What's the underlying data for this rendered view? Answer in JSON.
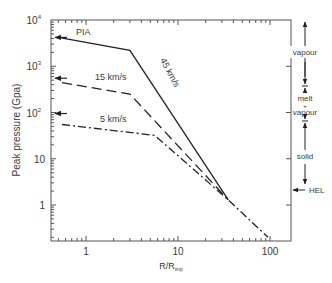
{
  "chart_data": {
    "type": "line",
    "title": "",
    "xlabel": "R/R",
    "xlabel_sub": "imp",
    "ylabel": "Peak pressure (Gpa)",
    "xscale": "log",
    "yscale": "log",
    "xlim": [
      0.42,
      160
    ],
    "ylim": [
      0.16,
      10000
    ],
    "grid": false,
    "x_ticks": [
      {
        "value": 1,
        "label": "1"
      },
      {
        "value": 10,
        "label": "10"
      },
      {
        "value": 100,
        "label": "100"
      }
    ],
    "y_ticks": [
      {
        "value": 1,
        "label": "1",
        "sup": ""
      },
      {
        "value": 10,
        "label": "10",
        "sup": ""
      },
      {
        "value": 100,
        "label": "10",
        "sup": "2"
      },
      {
        "value": 1000,
        "label": "10",
        "sup": "3"
      },
      {
        "value": 10000,
        "label": "10",
        "sup": "4"
      }
    ],
    "series": [
      {
        "name": "45 km/s",
        "label": "45 km/s",
        "style": "solid",
        "points": [
          [
            0.5,
            4200
          ],
          [
            3.0,
            2200
          ],
          [
            35,
            1.3
          ]
        ]
      },
      {
        "name": "15 km/s",
        "label": "15 km/s",
        "style": "dashed",
        "points": [
          [
            0.55,
            440
          ],
          [
            3.0,
            250
          ],
          [
            35,
            1.3
          ]
        ]
      },
      {
        "name": "5 km/s",
        "label": "5 km/s",
        "style": "dashdot",
        "points": [
          [
            0.55,
            55
          ],
          [
            5.6,
            32
          ],
          [
            35,
            1.3
          ],
          [
            95,
            0.2
          ]
        ]
      }
    ],
    "annotations": {
      "left_arrows": [
        {
          "label": "PIA",
          "y": 4200
        },
        {
          "label": "",
          "y": 550
        },
        {
          "label": "",
          "y": 95
        }
      ],
      "right_regimes": [
        {
          "label": "vapour",
          "y_from": 10000,
          "y_to": 600
        },
        {
          "label_lines": [
            "melt",
            "+",
            "vapour"
          ],
          "y_from": 600,
          "y_to": 90
        },
        {
          "label": "solid",
          "y_from": 90,
          "y_to": 3
        },
        {
          "label": "HEL",
          "y": 2.5
        }
      ]
    }
  }
}
